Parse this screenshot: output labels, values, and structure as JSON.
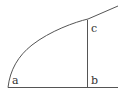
{
  "diagram": {
    "labels": {
      "a": "a",
      "b": "b",
      "c": "c"
    },
    "colors": {
      "stroke": "#555555",
      "text": "#333333",
      "background": "#ffffff"
    }
  }
}
